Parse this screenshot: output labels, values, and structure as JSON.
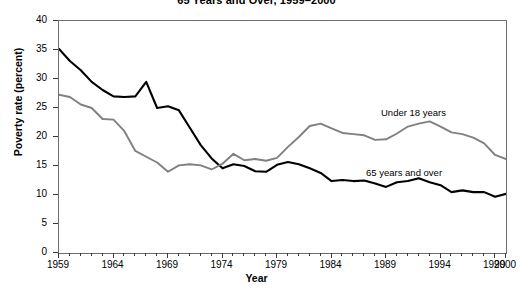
{
  "chart_data": {
    "type": "line",
    "title": "65 Years and Over, 1959–2000",
    "xlabel": "Year",
    "ylabel": "Poverty rate (percent)",
    "xlim": [
      1959,
      2000
    ],
    "ylim": [
      0,
      40
    ],
    "ytick_labels": [
      "0",
      "5",
      "10",
      "15",
      "20",
      "25",
      "30",
      "35",
      "40"
    ],
    "ytick_values": [
      0,
      5,
      10,
      15,
      20,
      25,
      30,
      35,
      40
    ],
    "xtick_labels": [
      "1959",
      "1964",
      "1969",
      "1974",
      "1979",
      "1984",
      "1989",
      "1994",
      "1999",
      "2000"
    ],
    "xtick_values": [
      1959,
      1964,
      1969,
      1974,
      1979,
      1984,
      1989,
      1994,
      1999,
      2000
    ],
    "grid": false,
    "legend_position": "inline-annotation",
    "x": [
      1959,
      1960,
      1961,
      1962,
      1963,
      1964,
      1965,
      1966,
      1967,
      1968,
      1969,
      1970,
      1971,
      1972,
      1973,
      1974,
      1975,
      1976,
      1977,
      1978,
      1979,
      1980,
      1981,
      1982,
      1983,
      1984,
      1985,
      1986,
      1987,
      1988,
      1989,
      1990,
      1991,
      1992,
      1993,
      1994,
      1995,
      1996,
      1997,
      1998,
      1999,
      2000
    ],
    "series": [
      {
        "name": "65 years and over",
        "color": "#000000",
        "label_text": "65 years and over",
        "values": [
          35.2,
          33.1,
          31.5,
          29.5,
          28.1,
          27.0,
          26.9,
          27.0,
          29.5,
          25.0,
          25.3,
          24.6,
          21.6,
          18.6,
          16.3,
          14.6,
          15.3,
          15.0,
          14.1,
          14.0,
          15.2,
          15.7,
          15.3,
          14.6,
          13.8,
          12.4,
          12.6,
          12.4,
          12.5,
          12.0,
          11.4,
          12.2,
          12.4,
          12.9,
          12.2,
          11.7,
          10.5,
          10.8,
          10.5,
          10.5,
          9.7,
          10.2
        ]
      },
      {
        "name": "Under 18 years",
        "color": "#808080",
        "label_text": "Under 18 years",
        "values": [
          27.3,
          26.9,
          25.6,
          25.0,
          23.1,
          23.0,
          21.0,
          17.6,
          16.6,
          15.6,
          14.0,
          15.1,
          15.3,
          15.1,
          14.4,
          15.4,
          17.1,
          16.0,
          16.2,
          15.9,
          16.4,
          18.3,
          20.0,
          21.9,
          22.3,
          21.5,
          20.7,
          20.5,
          20.3,
          19.5,
          19.6,
          20.6,
          21.8,
          22.3,
          22.7,
          21.8,
          20.8,
          20.5,
          19.9,
          18.9,
          16.9,
          16.2
        ]
      }
    ]
  }
}
